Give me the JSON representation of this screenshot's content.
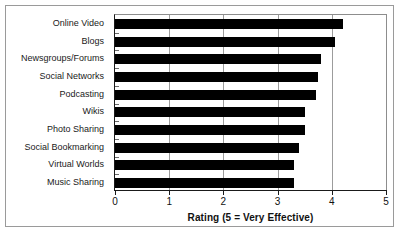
{
  "chart_data": {
    "type": "bar",
    "orientation": "horizontal",
    "title": "",
    "xlabel": "Rating (5 = Very Effective)",
    "ylabel": "",
    "xlim": [
      0,
      5
    ],
    "xticks": [
      "0",
      "1",
      "2",
      "3",
      "4",
      "5"
    ],
    "grid": true,
    "legend": false,
    "bar_color": "#000000",
    "categories": [
      "Online Video",
      "Blogs",
      "Newsgroups/Forums",
      "Social Networks",
      "Podcasting",
      "Wikis",
      "Photo Sharing",
      "Social Bookmarking",
      "Virtual Worlds",
      "Music Sharing"
    ],
    "values": [
      4.2,
      4.05,
      3.8,
      3.75,
      3.7,
      3.5,
      3.5,
      3.4,
      3.3,
      3.3
    ]
  }
}
